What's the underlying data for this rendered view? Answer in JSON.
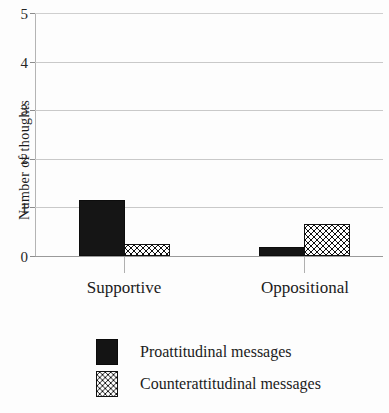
{
  "chart_data": {
    "type": "bar",
    "title": "",
    "xlabel": "",
    "ylabel": "Number of thoughts",
    "ylim": [
      0,
      5
    ],
    "yticks": [
      0,
      1,
      2,
      3,
      4,
      5
    ],
    "ytick_labels": [
      "0",
      "1",
      "2",
      "3",
      "4",
      "5"
    ],
    "grid": "horizontal",
    "legend_position": "bottom-left",
    "categories": [
      "Supportive",
      "Oppositional"
    ],
    "series": [
      {
        "name": "Proattitudinal messages",
        "pattern": "solid-black",
        "color": "#151515",
        "values": [
          1.15,
          0.18
        ]
      },
      {
        "name": "Counterattitudinal messages",
        "pattern": "checkerboard",
        "color": "#101010",
        "values": [
          0.25,
          0.65
        ]
      }
    ]
  },
  "axis": {
    "y_title": "Number of thoughts",
    "tick_0": "0",
    "tick_1": "1",
    "tick_2": "2",
    "tick_3": "3",
    "tick_4": "4",
    "tick_5": "5"
  },
  "categories": {
    "supportive": "Supportive",
    "oppositional": "Oppositional"
  },
  "legend": {
    "items": [
      {
        "label": "Proattitudinal messages"
      },
      {
        "label": "Counterattitudinal messages"
      }
    ]
  }
}
